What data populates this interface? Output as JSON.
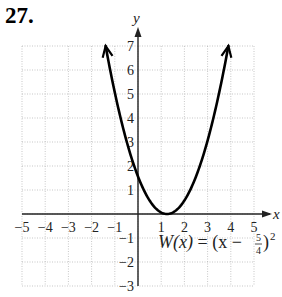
{
  "problem_number": "27.",
  "chart_data": {
    "type": "line",
    "title": "",
    "function_label": "W(x) = (x − 5/4)²",
    "function_parts": {
      "name": "W(x)",
      "eq": " = (x − ",
      "num": "5",
      "den": "4",
      "close": ")",
      "exp": "2"
    },
    "xlabel": "x",
    "ylabel": "y",
    "xlim": [
      -5,
      5
    ],
    "ylim": [
      -3,
      7
    ],
    "grid": true,
    "x_ticks": [
      -5,
      -4,
      -3,
      -2,
      -1,
      1,
      2,
      3,
      4,
      5
    ],
    "y_ticks": [
      -3,
      -2,
      -1,
      1,
      2,
      3,
      4,
      5,
      6,
      7
    ],
    "x_tick_labels": [
      "−5",
      "−4",
      "−3",
      "−2",
      "−1",
      "1",
      "2",
      "3",
      "4",
      "5"
    ],
    "y_tick_labels": [
      "−3",
      "−2",
      "−1",
      "1",
      "2",
      "3",
      "4",
      "5",
      "6",
      "7"
    ],
    "series": [
      {
        "name": "W(x) = (x − 5/4)^2",
        "vertex": [
          1.25,
          0
        ],
        "x": [
          -1.4,
          -1,
          -0.5,
          0,
          0.5,
          1,
          1.25,
          1.5,
          2,
          2.5,
          3,
          3.5,
          3.9
        ],
        "y": [
          7.02,
          5.06,
          3.06,
          1.56,
          0.56,
          0.06,
          0,
          0.06,
          0.56,
          1.56,
          3.06,
          5.06,
          7.02
        ],
        "arrows_at_ends": true,
        "color": "#000000"
      }
    ]
  },
  "colors": {
    "curve": "#000000",
    "grid": "#b0b0b0",
    "axis": "#222222"
  }
}
